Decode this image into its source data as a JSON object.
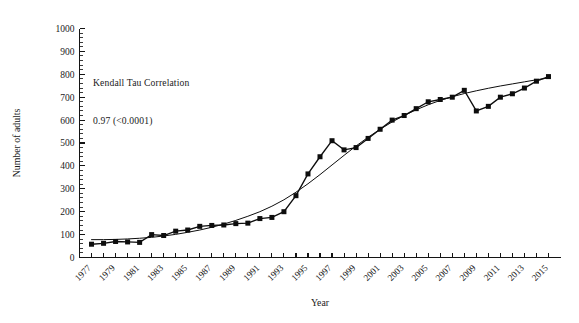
{
  "chart_data": {
    "type": "line",
    "title": "",
    "xlabel": "Year",
    "ylabel": "Number of adults",
    "xlim": [
      1976,
      2016
    ],
    "ylim": [
      0,
      1000
    ],
    "grid": false,
    "legend": null,
    "annotations": [
      {
        "name": "kendall-tau-annotation",
        "line1": "Kendall Tau Correlation",
        "line2": "0.97 (<0.0001)"
      }
    ],
    "y_ticks": [
      0,
      100,
      200,
      300,
      400,
      500,
      600,
      700,
      800,
      900,
      1000
    ],
    "y_minor_tick_step": 20,
    "x_tick_step": 1,
    "x_tick_labels": [
      "1977",
      "1979",
      "1981",
      "1983",
      "1985",
      "1987",
      "1989",
      "1991",
      "1993",
      "1995",
      "1997",
      "1999",
      "2001",
      "2003",
      "2005",
      "2007",
      "2009",
      "2011",
      "2013",
      "2015"
    ],
    "x_tick_label_rotation": -45,
    "x": [
      1977,
      1978,
      1979,
      1980,
      1981,
      1982,
      1983,
      1984,
      1985,
      1986,
      1987,
      1988,
      1989,
      1990,
      1991,
      1992,
      1993,
      1994,
      1995,
      1996,
      1997,
      1998,
      1999,
      2000,
      2001,
      2002,
      2003,
      2004,
      2005,
      2006,
      2007,
      2008,
      2009,
      2010,
      2011,
      2012,
      2013,
      2014,
      2015
    ],
    "series": [
      {
        "name": "Number of adults",
        "marker": "square",
        "color": "#0d0d0d",
        "values": [
          58,
          62,
          70,
          68,
          66,
          100,
          96,
          115,
          120,
          136,
          140,
          142,
          148,
          150,
          170,
          175,
          200,
          270,
          365,
          440,
          510,
          470,
          480,
          520,
          560,
          600,
          620,
          650,
          680,
          690,
          700,
          730,
          640,
          660,
          700,
          715,
          740,
          770,
          790
        ]
      },
      {
        "name": "Smoothed trend",
        "marker": "none",
        "color": "#0d0d0d",
        "values": [
          78,
          78,
          79,
          81,
          84,
          88,
          94,
          101,
          110,
          120,
          132,
          146,
          162,
          180,
          200,
          224,
          252,
          285,
          322,
          362,
          404,
          446,
          487,
          525,
          560,
          592,
          620,
          645,
          667,
          686,
          702,
          716,
          728,
          739,
          749,
          758,
          767,
          776,
          784
        ]
      }
    ],
    "series_actual": {
      "name": "Number of adults",
      "values_by_year": [
        [
          1977,
          58
        ],
        [
          1978,
          62
        ],
        [
          1979,
          70
        ],
        [
          1980,
          68
        ],
        [
          1981,
          66
        ],
        [
          1982,
          100
        ],
        [
          1983,
          96
        ],
        [
          1984,
          115
        ],
        [
          1985,
          120
        ],
        [
          1986,
          136
        ],
        [
          1987,
          140
        ],
        [
          1988,
          142
        ],
        [
          1989,
          148
        ],
        [
          1990,
          150
        ],
        [
          1991,
          170
        ],
        [
          1992,
          175
        ],
        [
          1993,
          200
        ],
        [
          1994,
          270
        ],
        [
          1995,
          365
        ],
        [
          1996,
          440
        ],
        [
          1997,
          510
        ],
        [
          1998,
          470
        ],
        [
          1999,
          480
        ],
        [
          2000,
          520
        ],
        [
          2001,
          560
        ],
        [
          2002,
          600
        ],
        [
          2003,
          620
        ],
        [
          2004,
          650
        ],
        [
          2005,
          680
        ],
        [
          2006,
          690
        ],
        [
          2007,
          700
        ],
        [
          2008,
          730
        ],
        [
          2009,
          640
        ],
        [
          2010,
          660
        ],
        [
          2011,
          700
        ],
        [
          2012,
          715
        ],
        [
          2013,
          740
        ],
        [
          2014,
          770
        ],
        [
          2015,
          790
        ]
      ]
    }
  }
}
